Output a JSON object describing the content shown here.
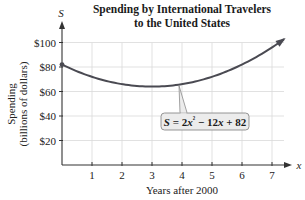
{
  "chart_data": {
    "type": "line",
    "title": "Spending by International Travelers to the United States",
    "title_lines": [
      "Spending by International Travelers",
      "to the United States"
    ],
    "xlabel": "Years after 2000",
    "ylabel": "Spending (billions of dollars)",
    "ylabel_lines": [
      "Spending",
      "(billions of dollars)"
    ],
    "x_axis_letter": "x",
    "y_axis_letter": "S",
    "x_ticks": [
      1,
      2,
      3,
      4,
      5,
      6,
      7
    ],
    "x_tick_labels": [
      "1",
      "2",
      "3",
      "4",
      "5",
      "6",
      "7"
    ],
    "y_ticks": [
      20,
      40,
      60,
      80,
      100
    ],
    "y_tick_labels": [
      "$20",
      "$40",
      "$60",
      "$80",
      "$100"
    ],
    "xlim": [
      0,
      7.6
    ],
    "ylim": [
      0,
      110
    ],
    "grid": true,
    "legend": null,
    "series": [
      {
        "name": "S = 2x^2 - 12x + 82",
        "formula": {
          "a": 2,
          "b": -12,
          "c": 82
        },
        "x": [
          0,
          1,
          2,
          3,
          4,
          5,
          6,
          7,
          7.4
        ],
        "values": [
          82,
          72,
          66,
          64,
          66,
          72,
          82,
          96,
          102.7
        ],
        "start_point_marked": true,
        "end_arrow": true
      }
    ],
    "annotations": [
      {
        "text": "S = 2x² − 12x + 82",
        "parts": [
          "S",
          " = 2",
          "x",
          "²",
          " − 12",
          "x",
          " + 82"
        ],
        "points_to_x": 3.9
      }
    ],
    "colors": {
      "curve": "#4a4a52",
      "grid": "#d9d9d9",
      "axis": "#333333",
      "annotation_box_fill": "#ececec",
      "annotation_box_stroke": "#8a8a8a"
    }
  }
}
